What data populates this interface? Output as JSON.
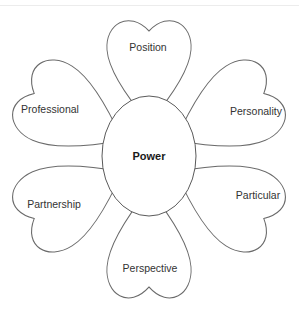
{
  "diagram": {
    "center": {
      "label": "Power"
    },
    "petals": [
      {
        "label": "Position"
      },
      {
        "label": "Personality"
      },
      {
        "label": "Particular"
      },
      {
        "label": "Perspective"
      },
      {
        "label": "Partnership"
      },
      {
        "label": "Professional"
      }
    ]
  }
}
